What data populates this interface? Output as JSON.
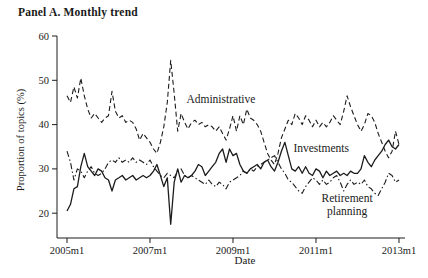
{
  "figure": {
    "title": "Panel A. Monthly trend",
    "xlabel": "Date",
    "ylabel": "Proportion of topics (%)"
  },
  "chart_data": {
    "type": "line",
    "title": "Panel A. Monthly trend",
    "xlabel": "Date",
    "ylabel": "Proportion of topics (%)",
    "x_frequency": "monthly",
    "x_start": "2005m1",
    "x_end": "2013m1",
    "x_tick_labels": [
      "2005m1",
      "2007m1",
      "2009m1",
      "2011m1",
      "2013m1"
    ],
    "x_tick_month_indices": [
      0,
      24,
      48,
      72,
      96
    ],
    "y_ticks": [
      20,
      30,
      40,
      50,
      60
    ],
    "ylim": [
      14,
      60
    ],
    "grid": false,
    "legend": "inline-annotations",
    "line_color": "#1c1c1c",
    "series": [
      {
        "name": "Administrative",
        "style": "dashed",
        "values": [
          46.5,
          45,
          48.5,
          46,
          50.5,
          46.5,
          43.5,
          41.5,
          42.5,
          41.5,
          40.5,
          41.5,
          42,
          47.5,
          43,
          41.5,
          42,
          40.5,
          41,
          40.5,
          39,
          36.5,
          38,
          37,
          36,
          34.5,
          33.5,
          36,
          39.5,
          45,
          54.5,
          47,
          38.5,
          42.5,
          40.5,
          39,
          40.5,
          41,
          40,
          40.5,
          39.5,
          40,
          39.5,
          38.5,
          39.5,
          38,
          36.5,
          39,
          42,
          38.5,
          42,
          40,
          43.5,
          41.5,
          41,
          40,
          38.5,
          36,
          33.5,
          32,
          31,
          33.5,
          37,
          39,
          41,
          40,
          42.5,
          41.5,
          40,
          42,
          41,
          39.5,
          41,
          39.5,
          40.5,
          39.5,
          40.5,
          42,
          41,
          40,
          43,
          46.5,
          44,
          42,
          40,
          38.5,
          40,
          42.5,
          42,
          40.5,
          38,
          36,
          34,
          32.5,
          34,
          38.5,
          35.5
        ]
      },
      {
        "name": "Investments",
        "style": "solid",
        "values": [
          20.5,
          22,
          25.5,
          26,
          30.5,
          33.5,
          30.5,
          29.5,
          28.5,
          30,
          29.5,
          28,
          27.5,
          25,
          27.5,
          28,
          28.5,
          27.5,
          28,
          28.5,
          27.5,
          28,
          28.5,
          28,
          28.5,
          29.5,
          31,
          28.5,
          26,
          28,
          17.5,
          27,
          30,
          27,
          28.5,
          28,
          28.5,
          29.5,
          31,
          30.5,
          28.5,
          29.5,
          30.5,
          31.5,
          33.5,
          34.5,
          31.5,
          34.5,
          33,
          33.5,
          31,
          29.5,
          29,
          30,
          30.5,
          31,
          30,
          31.5,
          32,
          30.5,
          29.5,
          31.5,
          34,
          36,
          33,
          30,
          29.5,
          30.5,
          29,
          30.5,
          29,
          28.5,
          30,
          29.5,
          28,
          29.5,
          28.5,
          29,
          29.5,
          28.5,
          29,
          28.5,
          29.5,
          29,
          29,
          30,
          33,
          31.5,
          30.5,
          32,
          33,
          34,
          35.5,
          36.5,
          35,
          34.5,
          35.5
        ]
      },
      {
        "name": "Retirement planning",
        "style": "dashdot",
        "values": [
          34,
          31.5,
          27.5,
          30,
          29.5,
          28,
          29.5,
          30.5,
          29,
          28.5,
          29,
          30,
          31.5,
          32,
          31.5,
          32.5,
          31.5,
          32,
          31.5,
          32.5,
          31.5,
          32,
          31.5,
          31,
          32,
          30.5,
          29.5,
          28.5,
          28,
          29,
          28.5,
          28,
          29.5,
          30,
          28.5,
          28,
          28.5,
          28,
          27.5,
          27,
          26.5,
          27.5,
          26.5,
          26,
          27,
          26.5,
          25.5,
          27,
          27.5,
          28,
          28.5,
          29.5,
          29,
          30,
          29.5,
          30.5,
          31,
          31.5,
          32,
          32.5,
          33,
          31.5,
          30,
          29,
          27.5,
          27,
          26,
          25,
          24.5,
          26,
          27,
          28,
          27.5,
          26.5,
          27.5,
          26.5,
          27,
          28,
          28.5,
          27,
          25,
          26.5,
          27.5,
          26.5,
          27,
          26.5,
          27.5,
          26,
          25.5,
          24.5,
          24,
          25.5,
          27,
          29,
          28.5,
          27,
          27.5
        ]
      }
    ],
    "annotations": [
      {
        "text": "Administrative",
        "lines": [
          "Administrative"
        ],
        "x_month": 44.5,
        "y_value": 44.8
      },
      {
        "text": "Investments",
        "lines": [
          "Investments"
        ],
        "x_month": 73.5,
        "y_value": 33.9
      },
      {
        "text": "Retirement planning",
        "lines": [
          "Retirement",
          "planning"
        ],
        "x_month": 81,
        "y_value": 22.6
      }
    ]
  }
}
